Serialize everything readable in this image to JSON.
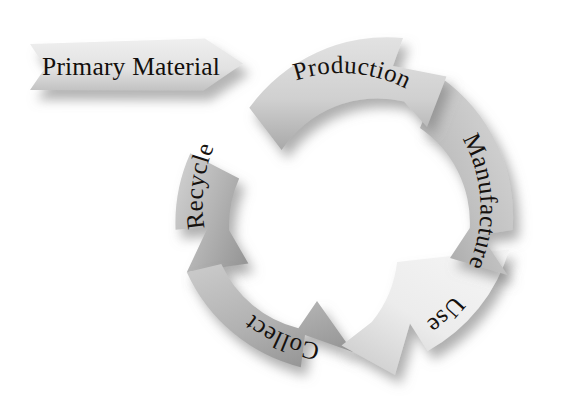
{
  "diagram": {
    "kind": "circular-lifecycle-diagram",
    "direction": "clockwise",
    "background_color": "#ffffff",
    "text_color": "#15110e",
    "shadow_color": "#8d8d8d",
    "input": {
      "label": "Primary Material",
      "shape": "chevron-tailed-arrow",
      "points_to": "Production",
      "fill_light": "#e9e9e9",
      "fill_dark": "#c3c3c3"
    },
    "ring": {
      "center_x": 345,
      "center_y": 205,
      "outer_radius": 170,
      "inner_radius": 115
    },
    "segments": [
      {
        "id": "production",
        "label": "Production",
        "position": "top",
        "order": 1,
        "fill_light": "#dcdcdc",
        "fill_dark": "#b2b2b2",
        "start_angle": -68,
        "end_angle": -6
      },
      {
        "id": "manufacture",
        "label": "Manufacture",
        "position": "right",
        "order": 2,
        "fill_light": "#d4d4d4",
        "fill_dark": "#a9a9a9",
        "start_angle": -4,
        "end_angle": 58
      },
      {
        "id": "use",
        "label": "Use",
        "position": "lower-right",
        "order": 3,
        "fill_light": "#f0f0f0",
        "fill_dark": "#d2d2d2",
        "start_angle": 60,
        "end_angle": 122
      },
      {
        "id": "collect",
        "label": "Collect",
        "position": "bottom-left",
        "order": 4,
        "fill_light": "#bdbdbd",
        "fill_dark": "#9b9b9b",
        "start_angle": 124,
        "end_angle": 186
      },
      {
        "id": "recycle",
        "label": "Recycle",
        "position": "left",
        "order": 5,
        "fill_light": "#c6c6c6",
        "fill_dark": "#9f9f9f",
        "start_angle": 188,
        "end_angle": 250
      }
    ]
  }
}
